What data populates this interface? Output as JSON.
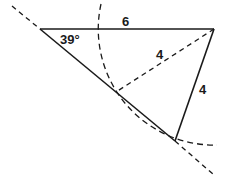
{
  "diagram": {
    "type": "geometry-triangle-construction",
    "labels": {
      "angle_A": "39°",
      "side_AB": "6",
      "dashed_BD": "4",
      "side_BC": "4"
    },
    "colors": {
      "stroke": "#1a1a1a",
      "background": "#ffffff"
    }
  }
}
